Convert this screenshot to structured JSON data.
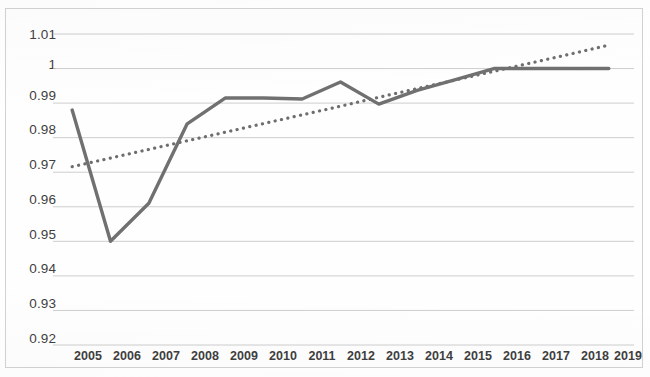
{
  "chart_data": {
    "type": "line",
    "title": "",
    "subtitle": "",
    "xlabel": "",
    "ylabel": "",
    "categories": [
      "2005",
      "2006",
      "2007",
      "2008",
      "2009",
      "2010",
      "2011",
      "2012",
      "2013",
      "2014",
      "2015",
      "2016",
      "2017",
      "2018",
      "2019"
    ],
    "ylim": [
      0.92,
      1.01
    ],
    "ytick_labels": [
      "1.01",
      "1",
      "0.99",
      "0.98",
      "0.97",
      "0.96",
      "0.95",
      "0.94",
      "0.93",
      "0.92"
    ],
    "ytick_values": [
      1.01,
      1.0,
      0.99,
      0.98,
      0.97,
      0.96,
      0.95,
      0.94,
      0.93,
      0.92
    ],
    "grid": true,
    "legend": "none",
    "series": [
      {
        "name": "Index",
        "style": "solid",
        "color": "#707070",
        "values": [
          0.988,
          0.95,
          0.961,
          0.984,
          0.9915,
          0.9915,
          0.9912,
          0.9961,
          0.9897,
          0.9937,
          0.9968,
          1.0,
          1.0,
          1.0,
          1.0
        ]
      },
      {
        "name": "Linear trendline",
        "style": "dotted",
        "color": "#6e6e6e",
        "values": [
          0.9716,
          0.9741,
          0.9766,
          0.9791,
          0.9816,
          0.9841,
          0.9866,
          0.9891,
          0.9917,
          0.9942,
          0.9967,
          0.9992,
          1.0017,
          1.0042,
          1.0068
        ]
      }
    ]
  },
  "axes": {
    "y_axis_name": "value-axis",
    "x_axis_name": "year-axis"
  }
}
